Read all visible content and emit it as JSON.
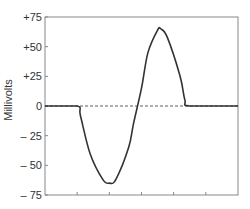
{
  "chart_data": {
    "type": "line",
    "title": "",
    "xlabel": "",
    "ylabel": "Millivolts",
    "ylim": [
      -75,
      75
    ],
    "xlim": [
      0,
      6
    ],
    "yticks": [
      75,
      50,
      25,
      0,
      -25,
      -50,
      -75
    ],
    "ytick_labels": [
      "+75",
      "+50",
      "+25",
      "0",
      "– 25",
      "– 50",
      "– 75"
    ],
    "xticks": [
      1,
      2,
      3,
      4,
      5
    ],
    "xtick_labels": [
      "",
      "",
      "",
      "",
      ""
    ],
    "grid": false,
    "legend": null,
    "baseline": {
      "y": 0,
      "style": "dashed"
    },
    "series": [
      {
        "name": "waveform",
        "color": "#333333",
        "x": [
          0,
          1.0,
          1.1,
          1.4,
          1.8,
          2.0,
          2.2,
          2.6,
          2.75,
          3.0,
          3.2,
          3.5,
          3.6,
          3.8,
          4.2,
          4.35,
          4.5,
          6
        ],
        "y": [
          0,
          0,
          -8,
          -40,
          -62,
          -65,
          -62,
          -35,
          -15,
          15,
          45,
          64,
          65,
          58,
          25,
          5,
          0,
          0
        ]
      }
    ]
  },
  "axis": {
    "ylabel": "Millivolts",
    "ytick_labels": [
      "+75",
      "+50",
      "+25",
      "0",
      "– 25",
      "– 50",
      "– 75"
    ]
  }
}
